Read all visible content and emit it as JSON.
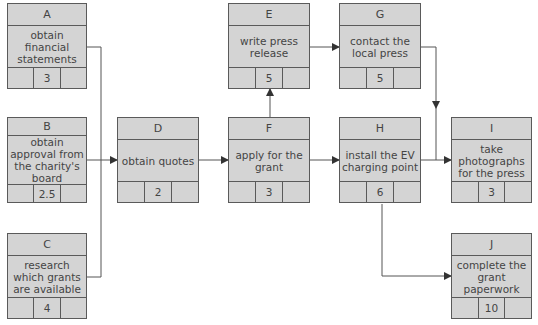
{
  "diagram": {
    "type": "activity-on-node network",
    "nodes": [
      {
        "id": "A",
        "activity": "obtain financial statements",
        "duration": "3"
      },
      {
        "id": "B",
        "activity": "obtain approval from the charity's board",
        "duration": "2.5"
      },
      {
        "id": "C",
        "activity": "research which grants are available",
        "duration": "4"
      },
      {
        "id": "D",
        "activity": "obtain quotes",
        "duration": "2"
      },
      {
        "id": "E",
        "activity": "write press release",
        "duration": "5"
      },
      {
        "id": "F",
        "activity": "apply for the grant",
        "duration": "3"
      },
      {
        "id": "G",
        "activity": "contact the local press",
        "duration": "5"
      },
      {
        "id": "H",
        "activity": "install the EV charging point",
        "duration": "6"
      },
      {
        "id": "I",
        "activity": "take photographs for the press",
        "duration": "3"
      },
      {
        "id": "J",
        "activity": "complete the grant paperwork",
        "duration": "10"
      }
    ],
    "edges": [
      {
        "from": "A",
        "to": "D"
      },
      {
        "from": "B",
        "to": "D"
      },
      {
        "from": "C",
        "to": "D"
      },
      {
        "from": "D",
        "to": "F"
      },
      {
        "from": "F",
        "to": "E"
      },
      {
        "from": "F",
        "to": "H"
      },
      {
        "from": "E",
        "to": "G"
      },
      {
        "from": "G",
        "to": "I"
      },
      {
        "from": "H",
        "to": "I"
      },
      {
        "from": "H",
        "to": "J"
      }
    ],
    "colors": {
      "box_fill": "#d4d4d4",
      "line": "#5a5a5a",
      "text": "#444444"
    }
  }
}
